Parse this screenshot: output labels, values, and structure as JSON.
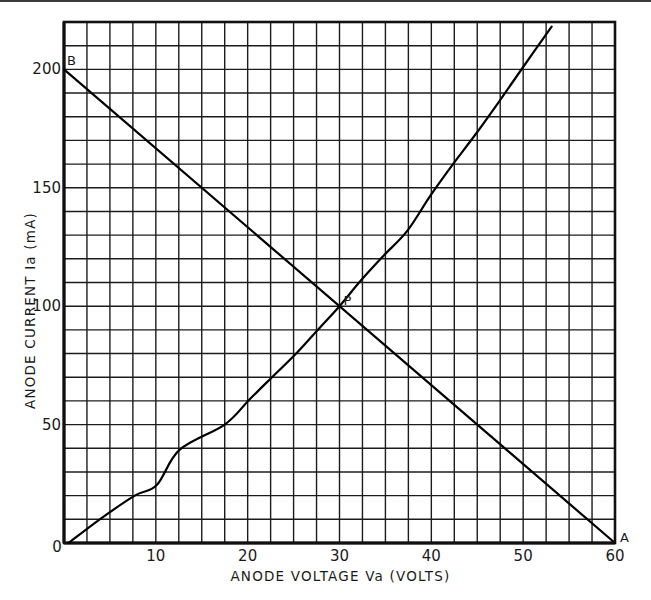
{
  "chart_data": {
    "type": "line",
    "title": "",
    "xlabel": "ANODE VOLTAGE Va (VOLTS)",
    "ylabel": "ANODE CURRENT Ia (mA)",
    "xlim": [
      0,
      60
    ],
    "ylim": [
      0,
      220
    ],
    "grid": true,
    "grid_x_step": 2.5,
    "grid_y_step": 10,
    "x_ticks": [
      0,
      10,
      20,
      30,
      40,
      50,
      60
    ],
    "x_tick_labels": [
      "0",
      "10",
      "20",
      "30",
      "40",
      "50",
      "60"
    ],
    "y_ticks": [
      50,
      100,
      150,
      200
    ],
    "y_tick_labels": [
      "50",
      "100",
      "150",
      "200"
    ],
    "legend": null,
    "series": [
      {
        "name": "Characteristic curve",
        "x": [
          0.5,
          3.9,
          7.7,
          10.1,
          12.6,
          17.5,
          20.2,
          22.6,
          25.2,
          27.7,
          30.0,
          32.3,
          34.8,
          37.4,
          39.9,
          42.4,
          44.8,
          47.3,
          50.0,
          53.1
        ],
        "y": [
          0,
          10,
          20,
          24.5,
          39.4,
          50,
          60.6,
          69.8,
          79.7,
          90.3,
          100,
          110.7,
          121.3,
          131.9,
          146.7,
          160.2,
          172.5,
          186,
          201,
          218
        ]
      },
      {
        "name": "Load line AB",
        "x": [
          0,
          60
        ],
        "y": [
          200,
          0
        ]
      }
    ],
    "annotations": [
      {
        "text": "B",
        "x": 0,
        "y": 200
      },
      {
        "text": "A",
        "x": 60,
        "y": 0
      },
      {
        "text": "P",
        "x": 30,
        "y": 100
      }
    ]
  }
}
